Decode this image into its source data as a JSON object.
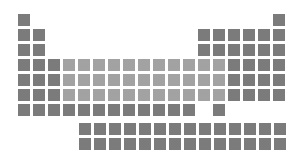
{
  "graphic": {
    "name": "periodic-table-icon",
    "colors": {
      "dark": "#7b7b7b",
      "light": "#a2a2a2",
      "background": "#ffffff"
    },
    "grid": {
      "origin_x": 18,
      "origin_y": 14,
      "pitch": 15,
      "cell_size": 12
    },
    "main_rows": [
      {
        "dark": [
          0,
          17
        ],
        "light": []
      },
      {
        "dark": [
          0,
          1,
          12,
          13,
          14,
          15,
          16,
          17
        ],
        "light": []
      },
      {
        "dark": [
          0,
          1,
          12,
          13,
          14,
          15,
          16,
          17
        ],
        "light": []
      },
      {
        "dark": [
          0,
          1,
          2,
          14,
          15,
          16,
          17
        ],
        "light": [
          3,
          4,
          5,
          6,
          7,
          8,
          9,
          10,
          11,
          12,
          13
        ]
      },
      {
        "dark": [
          0,
          1,
          2,
          14,
          15,
          16,
          17
        ],
        "light": [
          3,
          4,
          5,
          6,
          7,
          8,
          9,
          10,
          11,
          12,
          13
        ]
      },
      {
        "dark": [
          0,
          1,
          2,
          14,
          15,
          16,
          17
        ],
        "light": [
          3,
          4,
          5,
          6,
          7,
          8,
          9,
          10,
          11,
          12,
          13
        ]
      },
      {
        "dark": [
          0,
          1,
          2,
          3,
          4,
          5,
          6,
          7,
          8,
          9,
          10,
          11,
          13
        ],
        "light": []
      }
    ],
    "f_block": {
      "origin_x": 79,
      "rows_y": [
        123,
        138
      ],
      "count": 14
    }
  }
}
